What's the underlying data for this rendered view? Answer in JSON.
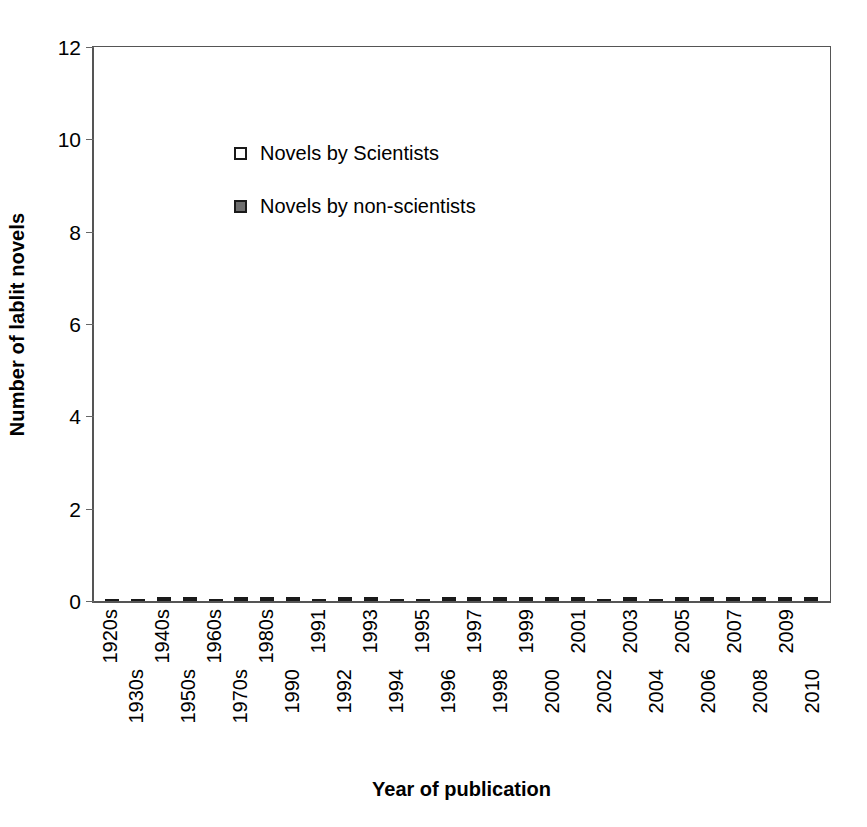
{
  "chart_data": {
    "type": "bar",
    "stacked": true,
    "title": "",
    "xlabel": "Year of publication",
    "ylabel": "Number of lablit novels",
    "ylim": [
      0,
      12
    ],
    "yticks": [
      0,
      2,
      4,
      6,
      8,
      10,
      12
    ],
    "grid": false,
    "legend_position": "top-left-inside",
    "categories": [
      "1920s",
      "1930s",
      "1940s",
      "1950s",
      "1960s",
      "1970s",
      "1980s",
      "1990",
      "1991",
      "1992",
      "1993",
      "1994",
      "1995",
      "1996",
      "1997",
      "1998",
      "1999",
      "2000",
      "2001",
      "2002",
      "2003",
      "2004",
      "2005",
      "2006",
      "2007",
      "2008",
      "2009",
      "2010"
    ],
    "series": [
      {
        "name": "Novels by non-scientists",
        "color": "#6e6e6e",
        "values": [
          1,
          0,
          1,
          1,
          2,
          2,
          4,
          2,
          1,
          2,
          2,
          0,
          3,
          2,
          6,
          3,
          2,
          3,
          5,
          4,
          5,
          5,
          6,
          7,
          4,
          3,
          6,
          1
        ]
      },
      {
        "name": "Novels by Scientists",
        "color": "#ffffff",
        "values": [
          0,
          1,
          1,
          1,
          0,
          1,
          2,
          1,
          0,
          1,
          1,
          1,
          0,
          1,
          3,
          2,
          1,
          1,
          1,
          0,
          3,
          0,
          4,
          1,
          2,
          2,
          1,
          3
        ]
      }
    ],
    "totals": [
      1,
      1,
      2,
      2,
      2,
      3,
      6,
      3,
      1,
      3,
      3,
      1,
      3,
      3,
      9,
      5,
      3,
      4,
      6,
      4,
      8,
      5,
      10,
      8,
      6,
      5,
      7,
      4
    ]
  },
  "legend": {
    "items": [
      {
        "label": "Novels by Scientists",
        "swatch": "light"
      },
      {
        "label": "Novels by non-scientists",
        "swatch": "dark"
      }
    ]
  }
}
